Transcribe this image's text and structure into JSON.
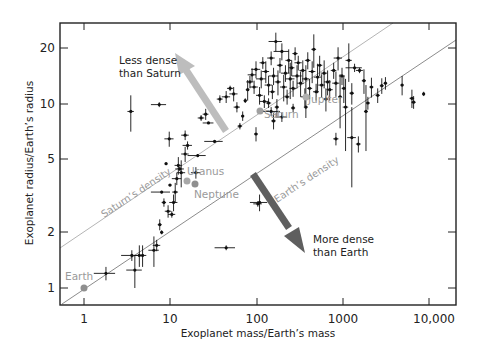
{
  "chart_data": {
    "type": "scatter",
    "title": "",
    "xlabel": "Exoplanet mass/Earth’s mass",
    "ylabel": "Exoplanet radius/Earth’s radius",
    "xscale": "log",
    "yscale": "log",
    "xlim": [
      0.53,
      13000
    ],
    "ylim": [
      0.81,
      26
    ],
    "x_ticks": [
      1,
      10,
      100,
      1000,
      10000
    ],
    "x_tick_labels": [
      "1",
      "10",
      "100",
      "1000",
      "10,000"
    ],
    "y_ticks": [
      1,
      2,
      5,
      10,
      20
    ],
    "y_tick_labels": [
      "1",
      "2",
      "5",
      "10",
      "20"
    ],
    "grid": false,
    "legend": null,
    "reference_lines": [
      {
        "name": "Saturn’s density",
        "label": "Saturn’s density",
        "color": "#b0b0b0",
        "through": [
          95,
          9.1
        ],
        "slope_loglog": 0.333
      },
      {
        "name": "Earth’s density",
        "label": "Earth’s density",
        "color": "#8a8a8a",
        "through": [
          1,
          1
        ],
        "slope_loglog": 0.333
      }
    ],
    "solar_system_planets": [
      {
        "name": "Earth",
        "mass": 1,
        "radius": 1
      },
      {
        "name": "Uranus",
        "mass": 14.5,
        "radius": 4.0
      },
      {
        "name": "Neptune",
        "mass": 17.1,
        "radius": 3.9
      },
      {
        "name": "Saturn",
        "mass": 95,
        "radius": 9.1
      },
      {
        "name": "Jupiter",
        "mass": 318,
        "radius": 11.2
      }
    ],
    "annotations": [
      {
        "text_line1": "Less dense",
        "text_line2": "than Saturn",
        "arrow": "up-left",
        "arrow_color": "#bdbdbd"
      },
      {
        "text_line1": "More dense",
        "text_line2": "than Earth",
        "arrow": "down-right",
        "arrow_color": "#5f5f5f"
      }
    ],
    "exoplanets": [
      {
        "m": 1.8,
        "r": 1.2,
        "dm": 0.5,
        "dr": 0.1
      },
      {
        "m": 3.6,
        "r": 1.5,
        "dm": 0.9,
        "dr": 0.1
      },
      {
        "m": 3.9,
        "r": 1.25,
        "dm": 0.8,
        "dr": 0.25
      },
      {
        "m": 4.4,
        "r": 1.5,
        "dm": 0.6,
        "dr": 0.2
      },
      {
        "m": 4.8,
        "r": 1.5,
        "dm": 0.5,
        "dr": 0.2
      },
      {
        "m": 6.5,
        "r": 1.6,
        "dm": 0.9,
        "dr": 0.3
      },
      {
        "m": 7.0,
        "r": 1.7,
        "dm": 0.7,
        "dr": 0.12
      },
      {
        "m": 7.6,
        "r": 2.2,
        "dm": 0.4,
        "dr": 0.15
      },
      {
        "m": 8.0,
        "r": 2.0,
        "dm": 0.3,
        "dr": 0.05
      },
      {
        "m": 8.5,
        "r": 2.9,
        "dm": 0.5,
        "dr": 0.15
      },
      {
        "m": 9.5,
        "r": 2.6,
        "dm": 0.8,
        "dr": 0.2
      },
      {
        "m": 11,
        "r": 2.9,
        "dm": 1.2,
        "dr": 0.3
      },
      {
        "m": 11.5,
        "r": 3.3,
        "dm": 0.9,
        "dr": 0.4
      },
      {
        "m": 10.5,
        "r": 2.5,
        "dm": 1.0,
        "dr": 0.1
      },
      {
        "m": 12,
        "r": 3.9,
        "dm": 1.5,
        "dr": 0.3
      },
      {
        "m": 10,
        "r": 3.6,
        "dm": 0.4,
        "dr": 0.05
      },
      {
        "m": 8.0,
        "r": 3.3,
        "dm": 2.0,
        "dr": 0.05
      },
      {
        "m": 9.0,
        "r": 4.7,
        "dm": 0.3,
        "dr": 0.05
      },
      {
        "m": 13,
        "r": 4.4,
        "dm": 1.5,
        "dr": 0.1
      },
      {
        "m": 15,
        "r": 5.3,
        "dm": 1.5,
        "dr": 0.5
      },
      {
        "m": 12.5,
        "r": 4.6,
        "dm": 1.2,
        "dr": 0.5
      },
      {
        "m": 20,
        "r": 4.2,
        "dm": 2.5,
        "dr": 0.3
      },
      {
        "m": 16,
        "r": 5.9,
        "dm": 2.0,
        "dr": 0.3
      },
      {
        "m": 21,
        "r": 5.2,
        "dm": 5.0,
        "dr": 0.1
      },
      {
        "m": 13.5,
        "r": 4.2,
        "dm": 1.5,
        "dr": 0.7
      },
      {
        "m": 9.8,
        "r": 6.4,
        "dm": 1.2,
        "dr": 0.6
      },
      {
        "m": 15,
        "r": 6.7,
        "dm": 1.5,
        "dr": 0.4
      },
      {
        "m": 23,
        "r": 8.3,
        "dm": 2.0,
        "dr": 0.3
      },
      {
        "m": 3.5,
        "r": 9.0,
        "dm": 0.3,
        "dr": 2.0
      },
      {
        "m": 7.5,
        "r": 9.8,
        "dm": 1.5,
        "dr": 0.3
      },
      {
        "m": 26,
        "r": 8.7,
        "dm": 2.0,
        "dr": 0.6
      },
      {
        "m": 33,
        "r": 6.2,
        "dm": 8.0,
        "dr": 0.1
      },
      {
        "m": 38,
        "r": 10.5,
        "dm": 3.0,
        "dr": 0.5
      },
      {
        "m": 45,
        "r": 10.8,
        "dm": 5.0,
        "dr": 0.8
      },
      {
        "m": 55,
        "r": 11.2,
        "dm": 6.0,
        "dr": 1.0
      },
      {
        "m": 60,
        "r": 9.5,
        "dm": 5.0,
        "dr": 0.6
      },
      {
        "m": 50,
        "r": 12.0,
        "dm": 4.0,
        "dr": 0.4
      },
      {
        "m": 70,
        "r": 8.5,
        "dm": 3.0,
        "dr": 0.5
      },
      {
        "m": 75,
        "r": 10.3,
        "dm": 3.0,
        "dr": 0.3
      },
      {
        "m": 80,
        "r": 11.8,
        "dm": 4.0,
        "dr": 1.5
      },
      {
        "m": 85,
        "r": 13.0,
        "dm": 8.0,
        "dr": 1.0
      },
      {
        "m": 90,
        "r": 14.2,
        "dm": 10.0,
        "dr": 1.2
      },
      {
        "m": 95,
        "r": 12.2,
        "dm": 10.0,
        "dr": 1.0
      },
      {
        "m": 100,
        "r": 15.2,
        "dm": 12.0,
        "dr": 1.6
      },
      {
        "m": 110,
        "r": 11.0,
        "dm": 10.0,
        "dr": 1.2
      },
      {
        "m": 115,
        "r": 13.5,
        "dm": 15.0,
        "dr": 1.5
      },
      {
        "m": 120,
        "r": 16.5,
        "dm": 10.0,
        "dr": 1.2
      },
      {
        "m": 125,
        "r": 10.2,
        "dm": 15.0,
        "dr": 0.8
      },
      {
        "m": 130,
        "r": 14.8,
        "dm": 12.0,
        "dr": 2.0
      },
      {
        "m": 140,
        "r": 12.5,
        "dm": 14.0,
        "dr": 1.5
      },
      {
        "m": 150,
        "r": 17.5,
        "dm": 15.0,
        "dr": 1.5
      },
      {
        "m": 155,
        "r": 11.5,
        "dm": 12.0,
        "dr": 1.0
      },
      {
        "m": 160,
        "r": 14.0,
        "dm": 20.0,
        "dr": 1.5
      },
      {
        "m": 170,
        "r": 21.5,
        "dm": 30.0,
        "dr": 2.5
      },
      {
        "m": 175,
        "r": 9.5,
        "dm": 10.0,
        "dr": 1.0
      },
      {
        "m": 180,
        "r": 13.0,
        "dm": 15.0,
        "dr": 2.0
      },
      {
        "m": 190,
        "r": 16.0,
        "dm": 15.0,
        "dr": 1.5
      },
      {
        "m": 200,
        "r": 19.0,
        "dm": 40.0,
        "dr": 2.0
      },
      {
        "m": 210,
        "r": 12.2,
        "dm": 20.0,
        "dr": 2.0
      },
      {
        "m": 220,
        "r": 14.5,
        "dm": 25.0,
        "dr": 1.5
      },
      {
        "m": 230,
        "r": 10.8,
        "dm": 15.0,
        "dr": 1.0
      },
      {
        "m": 240,
        "r": 17.0,
        "dm": 20.0,
        "dr": 2.5
      },
      {
        "m": 250,
        "r": 13.5,
        "dm": 30.0,
        "dr": 3.0
      },
      {
        "m": 260,
        "r": 15.5,
        "dm": 20.0,
        "dr": 1.5
      },
      {
        "m": 270,
        "r": 12.0,
        "dm": 25.0,
        "dr": 1.2
      },
      {
        "m": 285,
        "r": 18.5,
        "dm": 20.0,
        "dr": 1.5
      },
      {
        "m": 300,
        "r": 14.0,
        "dm": 40.0,
        "dr": 2.0
      },
      {
        "m": 310,
        "r": 16.5,
        "dm": 30.0,
        "dr": 1.5
      },
      {
        "m": 330,
        "r": 12.8,
        "dm": 30.0,
        "dr": 2.0
      },
      {
        "m": 350,
        "r": 15.0,
        "dm": 30.0,
        "dr": 2.0
      },
      {
        "m": 370,
        "r": 10.8,
        "dm": 40.0,
        "dr": 1.2
      },
      {
        "m": 380,
        "r": 13.5,
        "dm": 35.0,
        "dr": 2.5
      },
      {
        "m": 400,
        "r": 17.0,
        "dm": 30.0,
        "dr": 1.8
      },
      {
        "m": 420,
        "r": 12.0,
        "dm": 30.0,
        "dr": 1.5
      },
      {
        "m": 450,
        "r": 14.8,
        "dm": 40.0,
        "dr": 2.0
      },
      {
        "m": 470,
        "r": 19.5,
        "dm": 30.0,
        "dr": 4.0
      },
      {
        "m": 500,
        "r": 11.5,
        "dm": 40.0,
        "dr": 1.2
      },
      {
        "m": 520,
        "r": 13.8,
        "dm": 50.0,
        "dr": 2.5
      },
      {
        "m": 550,
        "r": 16.0,
        "dm": 40.0,
        "dr": 2.0
      },
      {
        "m": 580,
        "r": 12.5,
        "dm": 50.0,
        "dr": 1.8
      },
      {
        "m": 620,
        "r": 14.5,
        "dm": 50.0,
        "dr": 2.5
      },
      {
        "m": 650,
        "r": 10.5,
        "dm": 40.0,
        "dr": 1.5
      },
      {
        "m": 680,
        "r": 13.0,
        "dm": 60.0,
        "dr": 2.0
      },
      {
        "m": 720,
        "r": 11.8,
        "dm": 60.0,
        "dr": 1.5
      },
      {
        "m": 800,
        "r": 15.0,
        "dm": 60.0,
        "dr": 1.5
      },
      {
        "m": 850,
        "r": 12.8,
        "dm": 80.0,
        "dr": 2.0
      },
      {
        "m": 900,
        "r": 17.5,
        "dm": 100.0,
        "dr": 2.5
      },
      {
        "m": 950,
        "r": 10.8,
        "dm": 50.0,
        "dr": 3.5
      },
      {
        "m": 1000,
        "r": 14.0,
        "dm": 80.0,
        "dr": 1.5
      },
      {
        "m": 1050,
        "r": 12.0,
        "dm": 60.0,
        "dr": 2.0
      },
      {
        "m": 1100,
        "r": 9.5,
        "dm": 80.0,
        "dr": 4.0
      },
      {
        "m": 1200,
        "r": 17.0,
        "dm": 100.0,
        "dr": 4.0
      },
      {
        "m": 1300,
        "r": 11.3,
        "dm": 80.0,
        "dr": 1.5
      },
      {
        "m": 1400,
        "r": 15.5,
        "dm": 300.0,
        "dr": 0.8
      },
      {
        "m": 1600,
        "r": 15.0,
        "dm": 150.0,
        "dr": 0.5
      },
      {
        "m": 1800,
        "r": 13.2,
        "dm": 100.0,
        "dr": 2.0
      },
      {
        "m": 1900,
        "r": 9.0,
        "dm": 100.0,
        "dr": 3.5
      },
      {
        "m": 2000,
        "r": 10.0,
        "dm": 100.0,
        "dr": 0.8
      },
      {
        "m": 2200,
        "r": 12.2,
        "dm": 120.0,
        "dr": 1.5
      },
      {
        "m": 2600,
        "r": 11.0,
        "dm": 150.0,
        "dr": 1.0
      },
      {
        "m": 2900,
        "r": 12.4,
        "dm": 150.0,
        "dr": 1.2
      },
      {
        "m": 3200,
        "r": 12.8,
        "dm": 150.0,
        "dr": 1.0
      },
      {
        "m": 5000,
        "r": 12.5,
        "dm": 200.0,
        "dr": 1.5
      },
      {
        "m": 6500,
        "r": 10.6,
        "dm": 400.0,
        "dr": 1.2
      },
      {
        "m": 6800,
        "r": 10.1,
        "dm": 400.0,
        "dr": 0.8
      },
      {
        "m": 8900,
        "r": 11.2,
        "dm": 300.0,
        "dr": 0.3
      },
      {
        "m": 150,
        "r": 9.0,
        "dm": 40.0,
        "dr": 0.5
      },
      {
        "m": 160,
        "r": 8.0,
        "dm": 10.0,
        "dr": 0.8
      },
      {
        "m": 140,
        "r": 10.0,
        "dm": 10.0,
        "dr": 0.6
      },
      {
        "m": 200,
        "r": 8.4,
        "dm": 30.0,
        "dr": 0.5
      },
      {
        "m": 270,
        "r": 9.4,
        "dm": 15.0,
        "dr": 0.5
      },
      {
        "m": 380,
        "r": 9.5,
        "dm": 20.0,
        "dr": 1.2
      },
      {
        "m": 1300,
        "r": 6.5,
        "dm": 150.0,
        "dr": 3.0
      },
      {
        "m": 1550,
        "r": 6.0,
        "dm": 100.0,
        "dr": 0.6
      },
      {
        "m": 850,
        "r": 6.4,
        "dm": 60.0,
        "dr": 0.5
      },
      {
        "m": 110,
        "r": 2.9,
        "dm": 25.0,
        "dr": 0.3
      },
      {
        "m": 105,
        "r": 2.85,
        "dm": 12.0,
        "dr": 0.1
      },
      {
        "m": 45,
        "r": 1.65,
        "dm": 12.0,
        "dr": 0.05
      },
      {
        "m": 65,
        "r": 7.5,
        "dm": 4.0,
        "dr": 0.3
      },
      {
        "m": 28,
        "r": 7.8,
        "dm": 4.0,
        "dr": 0.1
      },
      {
        "m": 100,
        "r": 6.8,
        "dm": 5.0,
        "dr": 0.6
      }
    ]
  },
  "axes": {
    "x_title": "Exoplanet mass/Earth’s mass",
    "y_title": "Exoplanet radius/Earth’s radius",
    "x_tick_labels": [
      "1",
      "10",
      "100",
      "1000",
      "10,000"
    ],
    "y_tick_labels": [
      "1",
      "2",
      "5",
      "10",
      "20"
    ]
  },
  "labels": {
    "less_dense_1": "Less dense",
    "less_dense_2": "than Saturn",
    "more_dense_1": "More dense",
    "more_dense_2": "than Earth",
    "saturn_density": "Saturn’s density",
    "earth_density": "Earth’s density",
    "earth": "Earth",
    "uranus": "Uranus",
    "neptune": "Neptune",
    "saturn": "Saturn",
    "jupiter": "Jupiter"
  },
  "colors": {
    "axis": "#222222",
    "points": "#111111",
    "planet_marker": "#9a9a9a",
    "saturn_line": "#b5b5b5",
    "earth_line": "#8c8c8c",
    "less_dense_arrow": "#bdbdbd",
    "more_dense_arrow": "#5f5f5f"
  }
}
